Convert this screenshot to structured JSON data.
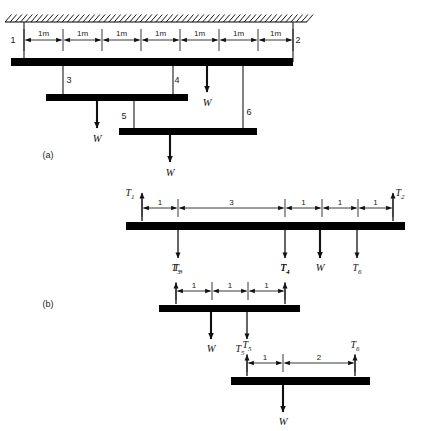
{
  "figure": {
    "background_color": "#ffffff",
    "ink_color": "#000000",
    "panels": [
      {
        "id": "a",
        "label": "(a)",
        "x": 48,
        "y": 158
      },
      {
        "id": "b",
        "label": "(b)",
        "x": 48,
        "y": 307
      }
    ]
  },
  "panel_a": {
    "support": {
      "type": "fixed-ceiling-hatch",
      "x1": 5,
      "x2": 307,
      "y": 22
    },
    "beams": [
      {
        "name": "top-beam",
        "x1": 11,
        "x2": 293,
        "y": 58,
        "h": 8
      },
      {
        "name": "middle-beam",
        "x1": 46,
        "x2": 188,
        "y": 94,
        "h": 7
      },
      {
        "name": "lower-beam",
        "x1": 119,
        "x2": 257,
        "y": 128,
        "h": 7
      }
    ],
    "node_labels": [
      {
        "text": "1",
        "x": 13,
        "y": 43
      },
      {
        "text": "2",
        "x": 298,
        "y": 43
      },
      {
        "text": "3",
        "x": 69,
        "y": 83
      },
      {
        "text": "4",
        "x": 177,
        "y": 83
      },
      {
        "text": "5",
        "x": 124,
        "y": 119
      },
      {
        "text": "6",
        "x": 249,
        "y": 115
      }
    ],
    "dimensions": {
      "label": "1m",
      "y_line": 40,
      "count": 7,
      "tick_x": [
        24,
        63,
        102,
        141,
        180,
        219,
        258,
        293
      ],
      "labels": [
        "1m",
        "1m",
        "1m",
        "1m",
        "1m",
        "1m",
        "1m"
      ]
    },
    "hangers": [
      {
        "name": "hanger-1",
        "x": 24,
        "y1": 22,
        "y2": 62
      },
      {
        "name": "hanger-2",
        "x": 293,
        "y1": 22,
        "y2": 62
      },
      {
        "name": "hanger-3",
        "x": 63,
        "y1": 62,
        "y2": 97
      },
      {
        "name": "hanger-4",
        "x": 173,
        "y1": 62,
        "y2": 97
      },
      {
        "name": "hanger-5",
        "x": 134,
        "y1": 97,
        "y2": 131
      },
      {
        "name": "hanger-6",
        "x": 243,
        "y1": 62,
        "y2": 131
      }
    ],
    "loads": [
      {
        "name": "load-w-middle",
        "label": "W",
        "x": 97,
        "y1": 101,
        "y2": 128,
        "label_x": 97,
        "label_y": 142
      },
      {
        "name": "load-w-top",
        "label": "W",
        "x": 207,
        "y1": 66,
        "y2": 92,
        "label_x": 207,
        "label_y": 106
      },
      {
        "name": "load-w-lower",
        "label": "W",
        "x": 170,
        "y1": 135,
        "y2": 162,
        "label_x": 170,
        "label_y": 176
      }
    ]
  },
  "panel_b": {
    "beam_1": {
      "name": "fbd-beam-1",
      "x1": 126,
      "x2": 405,
      "y": 222,
      "h": 8,
      "reactions_up": [
        {
          "label": "T",
          "sub": "1",
          "x": 142,
          "y_tip": 193,
          "y_base": 221,
          "label_x": 130,
          "label_y": 196
        },
        {
          "label": "T",
          "sub": "2",
          "x": 393,
          "y_tip": 193,
          "y_base": 221,
          "label_x": 400,
          "label_y": 196
        }
      ],
      "dim_y": 208,
      "dim_ticks": [
        142,
        178,
        285,
        322,
        358,
        393
      ],
      "dim_labels": [
        "1",
        "3",
        "1",
        "1",
        "1"
      ],
      "forces_down": [
        {
          "label": "T",
          "sub": "3",
          "x": 178,
          "y1": 230,
          "y2": 258,
          "label_x": 178,
          "label_y": 271,
          "thick": false
        },
        {
          "label": "T",
          "sub": "4",
          "x": 285,
          "y1": 230,
          "y2": 258,
          "label_x": 285,
          "label_y": 271,
          "thick": false
        },
        {
          "label": "W",
          "sub": "",
          "x": 320,
          "y1": 230,
          "y2": 258,
          "label_x": 320,
          "label_y": 271,
          "thick": true
        },
        {
          "label": "T",
          "sub": "6",
          "x": 357,
          "y1": 230,
          "y2": 258,
          "label_x": 357,
          "label_y": 271,
          "thick": false
        }
      ]
    },
    "beam_2": {
      "name": "fbd-beam-2",
      "x1": 159,
      "x2": 300,
      "y": 305,
      "h": 7,
      "reactions_up": [
        {
          "label": "T",
          "sub": "3",
          "x": 176,
          "y_tip": 283,
          "y_base": 304,
          "label_x": 176,
          "label_y": 271
        },
        {
          "label": "T",
          "sub": "4",
          "x": 285,
          "y_tip": 283,
          "y_base": 304,
          "label_x": 285,
          "label_y": 271
        }
      ],
      "dim_y": 291,
      "dim_ticks": [
        176,
        212,
        248,
        285
      ],
      "dim_labels": [
        "1",
        "1",
        "1"
      ],
      "forces_down": [
        {
          "label": "W",
          "sub": "",
          "x": 211,
          "y1": 312,
          "y2": 339,
          "label_x": 211,
          "label_y": 352,
          "thick": true
        },
        {
          "label": "T",
          "sub": "5",
          "x": 247,
          "y1": 312,
          "y2": 339,
          "label_x": 240,
          "label_y": 352,
          "thick": false
        }
      ]
    },
    "beam_3": {
      "name": "fbd-beam-3",
      "x1": 231,
      "x2": 370,
      "y": 377,
      "h": 8,
      "reactions_up": [
        {
          "label": "T",
          "sub": "5",
          "x": 247,
          "y_tip": 355,
          "y_base": 376,
          "label_x": 247,
          "label_y": 348
        },
        {
          "label": "T",
          "sub": "6",
          "x": 355,
          "y_tip": 355,
          "y_base": 376,
          "label_x": 355,
          "label_y": 348
        }
      ],
      "dim_y": 363,
      "dim_ticks": [
        247,
        283,
        355
      ],
      "dim_labels": [
        "1",
        "2"
      ],
      "forces_down": [
        {
          "label": "W",
          "sub": "",
          "x": 283,
          "y1": 385,
          "y2": 412,
          "label_x": 283,
          "label_y": 425,
          "thick": true
        }
      ]
    }
  }
}
